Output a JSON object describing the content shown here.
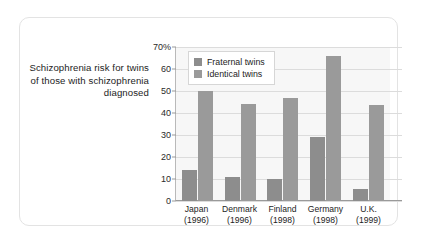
{
  "caption": "Schizophrenia risk for twins of those with schizophrenia diagnosed",
  "chart_data": {
    "type": "bar",
    "title": "Schizophrenia risk for twins of those with schizophrenia diagnosed",
    "xlabel": "",
    "ylabel": "",
    "ylim": [
      0,
      70
    ],
    "grid": true,
    "legend_position": "top-left-inside",
    "ytick_labels": [
      "0",
      "10",
      "20",
      "30",
      "40",
      "50",
      "60",
      "70%"
    ],
    "ytick_values": [
      0,
      10,
      20,
      30,
      40,
      50,
      60,
      70
    ],
    "categories": [
      "Japan",
      "Denmark",
      "Finland",
      "Germany",
      "U.K."
    ],
    "category_years": [
      "(1996)",
      "(1996)",
      "(1998)",
      "(1998)",
      "(1999)"
    ],
    "series": [
      {
        "name": "Fraternal twins",
        "color": "#8d8d8d",
        "values": [
          14,
          11,
          10,
          29,
          5.5
        ]
      },
      {
        "name": "Identical twins",
        "color": "#9a9a9a",
        "values": [
          50,
          44,
          47,
          66,
          43.5
        ]
      }
    ]
  }
}
